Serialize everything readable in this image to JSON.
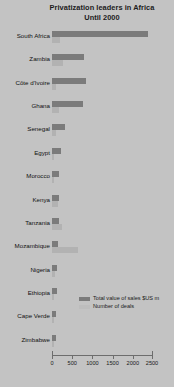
{
  "chart_data": {
    "type": "bar",
    "orientation": "horizontal",
    "title": "Privatization leaders in Africa",
    "subtitle": "Until 2000",
    "xlabel": "",
    "ylabel": "",
    "xlim": [
      0,
      2500
    ],
    "xticks": [
      0,
      500,
      1000,
      1500,
      2000,
      2500
    ],
    "xtick_labels": [
      "0",
      "500",
      "1000",
      "1500",
      "2000",
      "2500"
    ],
    "grid": false,
    "legend_position": "inside-right",
    "categories": [
      "South Africa",
      "Zambia",
      "Côte d'Ivoire",
      "Ghana",
      "Senegal",
      "Egypt",
      "Morocco",
      "Kenya",
      "Tanzania",
      "Mozambique",
      "Nigeria",
      "Ethiopia",
      "Cape Verde",
      "Zimbabwe"
    ],
    "series": [
      {
        "name": "Total value of sales $US m",
        "color": "#7b7b7b",
        "values": [
          2380,
          790,
          840,
          760,
          320,
          215,
          175,
          170,
          170,
          160,
          130,
          120,
          110,
          105
        ]
      },
      {
        "name": "Number of deals",
        "color": "#b2b2b2",
        "values": [
          190,
          260,
          100,
          170,
          90,
          50,
          60,
          160,
          250,
          640,
          65,
          60,
          55,
          45
        ]
      }
    ]
  },
  "legend": {
    "items": [
      {
        "label": "Total value of sales $US m",
        "swatch": "value"
      },
      {
        "label": "Number of deals",
        "swatch": "deals"
      }
    ]
  },
  "colors": {
    "background": "#c3c3c3",
    "series_value": "#7b7b7b",
    "series_deals": "#b2b2b2",
    "axis": "#6d6d6d",
    "text": "#1a1a1a"
  }
}
